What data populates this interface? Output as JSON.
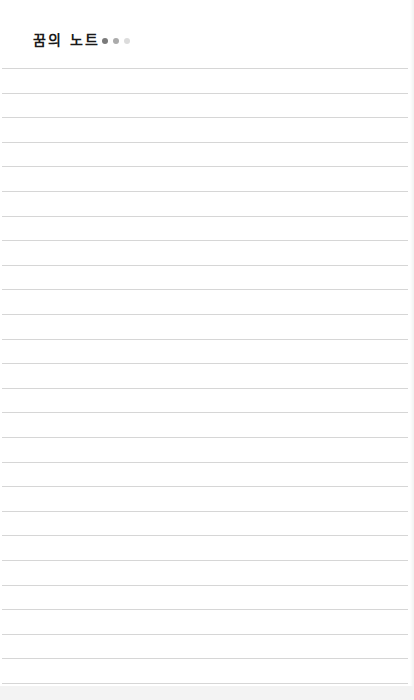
{
  "header": {
    "title": "꿈의 노트",
    "dots": [
      {
        "name": "dot-1",
        "color": "#7a7a7a"
      },
      {
        "name": "dot-2",
        "color": "#ababab"
      },
      {
        "name": "dot-3",
        "color": "#dcdcdc"
      }
    ]
  },
  "notebook": {
    "line_count": 26,
    "first_line_y": 68,
    "line_spacing": 24.6,
    "line_color": "#d6d6d6"
  }
}
